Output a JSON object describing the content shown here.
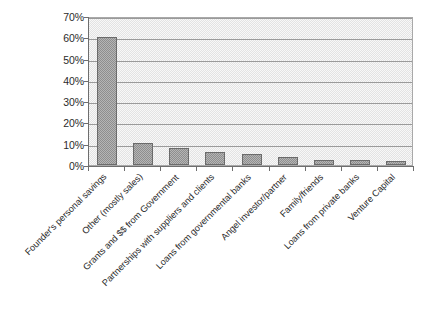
{
  "chart_data": {
    "type": "bar",
    "title": "",
    "xlabel": "",
    "ylabel": "",
    "ylim": [
      0,
      70
    ],
    "grid": true,
    "legend": false,
    "categories": [
      "Founder's personal savings",
      "Other (mostly sales)",
      "Grants and $$ from Government",
      "Partnerships with suppliers and clients",
      "Loans from governmental banks",
      "Angel investor/partner",
      "Family/friends",
      "Loans from private banks",
      "Venture Capital"
    ],
    "values": [
      60,
      10.5,
      8,
      6,
      5,
      4,
      2.5,
      2.2,
      2
    ],
    "y_ticks": [
      "0%",
      "10%",
      "20%",
      "30%",
      "40%",
      "50%",
      "60%",
      "70%"
    ],
    "y_tick_values": [
      0,
      10,
      20,
      30,
      40,
      50,
      60,
      70
    ],
    "bar_color": "#8e8e8e",
    "plot_background": "#e3e3e3",
    "gridline_color": "#9a9a9a",
    "axis_color": "#6e6e6e"
  }
}
